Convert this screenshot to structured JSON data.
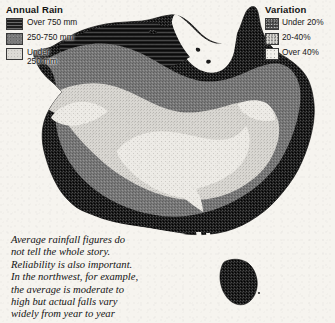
{
  "page": {
    "background_color": "#f6f4ef",
    "width": 335,
    "height": 323
  },
  "legend_annual_rain": {
    "title": "Annual Rain",
    "items": [
      {
        "label": "Over 750 mm",
        "swatch": "dark-horizontal-lines",
        "color": "#1d1d1d"
      },
      {
        "label": "250-750 mm",
        "swatch": "medium-gray",
        "color": "#7b7b7b"
      },
      {
        "label": "Under\n250 mm",
        "swatch": "light-gray",
        "color": "#dddbd6"
      }
    ]
  },
  "legend_variation": {
    "title": "Variation",
    "items": [
      {
        "label": "Under 20%",
        "swatch": "dark-stipple",
        "color": "#4a4a4a"
      },
      {
        "label": "20-40%",
        "swatch": "light-stipple",
        "color": "#dcdad5"
      },
      {
        "label": "Over 40%",
        "swatch": "white-stipple",
        "color": "#f3f1ec"
      }
    ]
  },
  "caption": {
    "text": "Average rainfall figures do\nnot tell the whole story.\nReliability is also important.\nIn the northwest, for example,\nthe average is moderate to\nhigh but actual falls vary\nwidely from year to year"
  },
  "map": {
    "name": "australia-rainfall-map",
    "landmass_label": "Australia mainland",
    "island_label": "Tasmania",
    "zones": [
      {
        "name": "coastal-high-rainfall",
        "annual_rain": "Over 750 mm",
        "color": "#1e1e1e"
      },
      {
        "name": "intermediate-rainfall",
        "annual_rain": "250-750 mm",
        "color": "#797979"
      },
      {
        "name": "arid-interior",
        "annual_rain": "Under 250 mm",
        "color": "#dcdad5"
      },
      {
        "name": "arid-core",
        "annual_rain": "Under 250 mm",
        "color": "#eceae5"
      }
    ]
  }
}
